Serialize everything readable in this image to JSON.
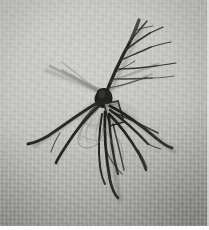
{
  "image": {
    "kind": "photograph",
    "subject": "plant seedling specimen with root system",
    "orientation": "portrait",
    "width_px": 209,
    "height_px": 230
  },
  "scene": {
    "background_name": "gray woven fabric cloth",
    "background_color": "#b6b6b4",
    "background_highlight_color": "#c8c8c6",
    "background_shade_color": "#a2a2a0",
    "lighting": "diffuse overhead, highlight upper-left, shadow lower-right",
    "bottom_trim_color": "#fdfdfd"
  },
  "specimen": {
    "name": "woody seedling / rooted cutting",
    "stem_color": "#30302e",
    "root_color": "#242422",
    "fine_root_color": "#6a6a66",
    "shadow_color": "rgba(40,40,38,0.35)",
    "parts": [
      {
        "name": "main-stem",
        "description": "dark woody stem rising from crown toward upper right"
      },
      {
        "name": "upper-branches",
        "description": "slender twigs fanning upward and to the right"
      },
      {
        "name": "crown-junction",
        "description": "thickened dark node where stem meets roots"
      },
      {
        "name": "pale-tag",
        "description": "small pale rectangular patch below the crown"
      },
      {
        "name": "left-roots",
        "description": "two thick roots sweeping left and slightly down"
      },
      {
        "name": "right-roots",
        "description": "several roots arcing right and downward"
      },
      {
        "name": "descending-roots",
        "description": "roots trailing straight down below the crown"
      },
      {
        "name": "fine-roots",
        "description": "faint wispy fibrous roots looping below the crown"
      }
    ]
  },
  "geometry": {
    "crown": {
      "x": 103,
      "y": 96
    },
    "stem_tip": {
      "x": 139,
      "y": 20
    },
    "leftmost_root_tip": {
      "x": 28,
      "y": 143
    },
    "rightmost_root_tip": {
      "x": 172,
      "y": 148
    },
    "lowest_root_tip": {
      "x": 118,
      "y": 198
    }
  }
}
